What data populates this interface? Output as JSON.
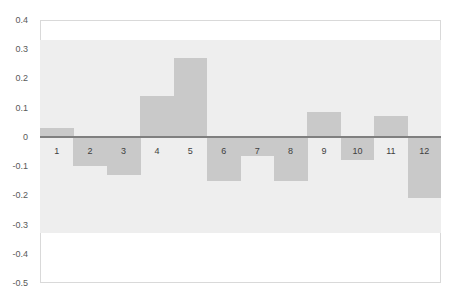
{
  "chart_data": {
    "type": "bar",
    "title": "",
    "xlabel": "",
    "ylabel": "",
    "categories": [
      "1",
      "2",
      "3",
      "4",
      "5",
      "6",
      "7",
      "8",
      "9",
      "10",
      "11",
      "12"
    ],
    "values": [
      0.03,
      -0.1,
      -0.13,
      0.14,
      0.27,
      -0.15,
      -0.065,
      -0.15,
      0.085,
      -0.08,
      0.07,
      -0.21
    ],
    "ylim": [
      -0.5,
      0.4
    ],
    "yticks": [
      "0.4",
      "0.3",
      "0.2",
      "0.1",
      "0",
      "-0.1",
      "-0.2",
      "-0.3",
      "-0.4",
      "-0.5"
    ],
    "ytick_values": [
      0.4,
      0.3,
      0.2,
      0.1,
      0,
      -0.1,
      -0.2,
      -0.3,
      -0.4,
      -0.5
    ],
    "band": {
      "upper": 0.33,
      "lower": -0.33,
      "color": "#eeeeee"
    },
    "grid": false,
    "legend": null,
    "colors": {
      "bar": "#c9c9c9",
      "zero_line": "#7f7f7f",
      "border": "#d9d9d9",
      "band": "#eeeeee"
    }
  }
}
